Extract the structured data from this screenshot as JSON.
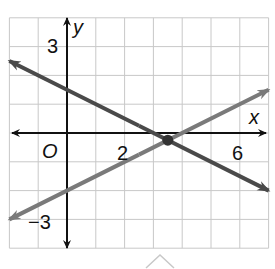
{
  "chart_data": {
    "type": "line",
    "title": "",
    "xlabel": "x",
    "ylabel": "y",
    "origin_label": "O",
    "xlim": [
      -2,
      7
    ],
    "ylim": [
      -4,
      4
    ],
    "grid": true,
    "x_tick_labels": [
      {
        "value": 2,
        "label": "2"
      },
      {
        "value": 6,
        "label": "6"
      }
    ],
    "y_tick_labels": [
      {
        "value": 3,
        "label": "3"
      },
      {
        "value": -3,
        "label": "−3"
      }
    ],
    "series": [
      {
        "name": "decreasing line",
        "equation": "y = -1/2 x + 3/2",
        "slope": -0.5,
        "intercept": 1.5,
        "color": "#4a4a4a",
        "x": [
          -2,
          7
        ],
        "y": [
          2.5,
          -2
        ]
      },
      {
        "name": "increasing line",
        "equation": "y = 1/2 x - 2",
        "slope": 0.5,
        "intercept": -2,
        "color": "#7a7a7a",
        "x": [
          -2,
          7
        ],
        "y": [
          -3,
          1.5
        ]
      }
    ],
    "annotations": [
      {
        "type": "point",
        "x": 3.5,
        "y": -0.25,
        "label": "intersection",
        "color": "#333333"
      }
    ],
    "legend": null
  },
  "colors": {
    "grid": "#c8c8c8",
    "axis": "#111111",
    "line_dark": "#4a4a4a",
    "line_light": "#7a7a7a"
  },
  "footer": {
    "caret_icon": "chevron-up-icon"
  }
}
